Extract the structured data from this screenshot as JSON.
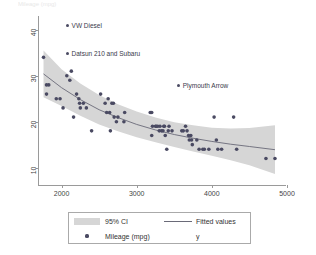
{
  "figure": {
    "top_title": "Mileage (mpg)"
  },
  "chart_data": {
    "type": "scatter",
    "title": "",
    "xlabel": "",
    "ylabel": "",
    "xlim": [
      1700,
      5000
    ],
    "ylim": [
      6,
      43
    ],
    "grid": false,
    "xticks": [
      2000,
      3000,
      4000,
      5000
    ],
    "yticks": [
      10,
      20,
      30,
      40
    ],
    "legend_position": "bottom",
    "legend": [
      {
        "label": "95% CI",
        "marker": "band"
      },
      {
        "label": "Fitted values",
        "marker": "line"
      },
      {
        "label": "Mileage (mpg)",
        "marker": "dot"
      },
      {
        "label": "y",
        "marker": "none"
      }
    ],
    "series": [
      {
        "name": "Mileage (mpg)",
        "type": "scatter",
        "marker": "circle",
        "color": "#4a4a62",
        "points": [
          [
            1760,
            34
          ],
          [
            1800,
            28
          ],
          [
            1830,
            28
          ],
          [
            1800,
            26
          ],
          [
            1930,
            25
          ],
          [
            1980,
            25
          ],
          [
            2020,
            23
          ],
          [
            2070,
            30
          ],
          [
            2110,
            29
          ],
          [
            2130,
            31
          ],
          [
            2160,
            21
          ],
          [
            2200,
            26
          ],
          [
            2230,
            25
          ],
          [
            2240,
            24
          ],
          [
            2250,
            23
          ],
          [
            2290,
            24
          ],
          [
            2330,
            23
          ],
          [
            2400,
            18
          ],
          [
            2520,
            26
          ],
          [
            2580,
            24
          ],
          [
            2600,
            22
          ],
          [
            2620,
            25
          ],
          [
            2640,
            22
          ],
          [
            2650,
            18
          ],
          [
            2670,
            24
          ],
          [
            2690,
            24
          ],
          [
            2700,
            21
          ],
          [
            2730,
            20
          ],
          [
            2750,
            21
          ],
          [
            2830,
            20
          ],
          [
            2840,
            22
          ],
          [
            3180,
            22
          ],
          [
            3200,
            22
          ],
          [
            3200,
            17
          ],
          [
            3210,
            19
          ],
          [
            3250,
            19
          ],
          [
            3260,
            19
          ],
          [
            3280,
            19
          ],
          [
            3300,
            18
          ],
          [
            3310,
            19
          ],
          [
            3330,
            18
          ],
          [
            3350,
            18
          ],
          [
            3360,
            19
          ],
          [
            3370,
            19
          ],
          [
            3380,
            17
          ],
          [
            3400,
            14
          ],
          [
            3420,
            18
          ],
          [
            3430,
            19
          ],
          [
            3470,
            18
          ],
          [
            3600,
            18
          ],
          [
            3620,
            18
          ],
          [
            3650,
            19
          ],
          [
            3670,
            18
          ],
          [
            3690,
            17
          ],
          [
            3700,
            16
          ],
          [
            3720,
            17
          ],
          [
            3730,
            16
          ],
          [
            3740,
            15
          ],
          [
            3800,
            16
          ],
          [
            3830,
            14
          ],
          [
            3880,
            14
          ],
          [
            3900,
            14
          ],
          [
            3960,
            14
          ],
          [
            4030,
            21
          ],
          [
            4060,
            16
          ],
          [
            4080,
            14
          ],
          [
            4130,
            14
          ],
          [
            4290,
            21
          ],
          [
            4330,
            14
          ],
          [
            4720,
            12
          ],
          [
            4840,
            12
          ]
        ]
      },
      {
        "name": "Fitted values",
        "type": "line",
        "color": "#6a6a78",
        "points": [
          [
            1760,
            30.4
          ],
          [
            2000,
            27.4
          ],
          [
            2250,
            24.8
          ],
          [
            2500,
            22.6
          ],
          [
            2750,
            20.9
          ],
          [
            3000,
            19.4
          ],
          [
            3250,
            18.2
          ],
          [
            3500,
            17.2
          ],
          [
            3750,
            16.4
          ],
          [
            4000,
            15.7
          ],
          [
            4250,
            15.1
          ],
          [
            4500,
            14.6
          ],
          [
            4840,
            13.9
          ]
        ]
      },
      {
        "name": "95% CI",
        "type": "band",
        "color": "#d6d6d6",
        "upper": [
          [
            1760,
            35.5
          ],
          [
            2000,
            31.4
          ],
          [
            2250,
            28.3
          ],
          [
            2500,
            25.8
          ],
          [
            2750,
            23.8
          ],
          [
            3000,
            22.2
          ],
          [
            3250,
            20.9
          ],
          [
            3500,
            19.9
          ],
          [
            3750,
            19.2
          ],
          [
            4000,
            18.7
          ],
          [
            4250,
            18.5
          ],
          [
            4500,
            18.6
          ],
          [
            4840,
            19.2
          ]
        ],
        "lower": [
          [
            1760,
            25.3
          ],
          [
            2000,
            23.4
          ],
          [
            2250,
            21.3
          ],
          [
            2500,
            19.4
          ],
          [
            2750,
            17.9
          ],
          [
            3000,
            16.6
          ],
          [
            3250,
            15.5
          ],
          [
            3500,
            14.5
          ],
          [
            3750,
            13.5
          ],
          [
            4000,
            12.6
          ],
          [
            4250,
            11.6
          ],
          [
            4500,
            10.5
          ],
          [
            4840,
            8.6
          ]
        ]
      }
    ],
    "annotations": [
      {
        "text": "VW Diesel",
        "x": 2060,
        "y": 41,
        "marker": "dot"
      },
      {
        "text": "Datsun 210 and Subaru",
        "x": 2060,
        "y": 35,
        "marker": "dot"
      },
      {
        "text": "Plymouth Arrow",
        "x": 3540,
        "y": 28,
        "marker": "dot"
      }
    ]
  }
}
